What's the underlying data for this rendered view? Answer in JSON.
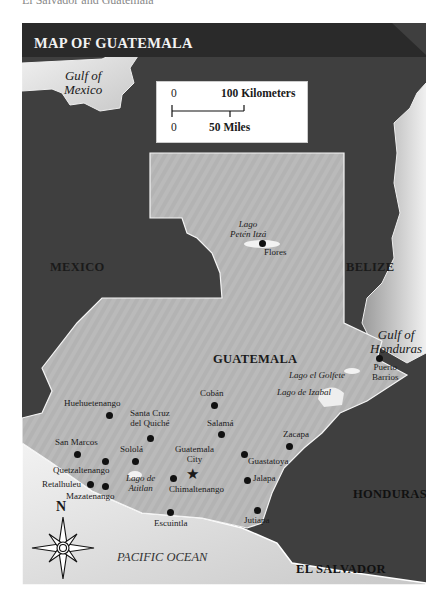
{
  "caption_top": "El Salvador and Guatemala",
  "map": {
    "title": "MAP OF GUATEMALA",
    "scale": {
      "km_zero": "0",
      "km_label": "100 Kilometers",
      "mi_zero": "0",
      "mi_label": "50 Miles"
    },
    "countries": {
      "mexico": "MEXICO",
      "belize": "BELIZE",
      "guatemala": "GUATEMALA",
      "honduras": "HONDURAS",
      "el_salvador": "EL SALVADOR"
    },
    "water": {
      "gulf_mexico_1": "Gulf of",
      "gulf_mexico_2": "Mexico",
      "gulf_honduras_1": "Gulf of",
      "gulf_honduras_2": "Honduras",
      "pacific": "PACIFIC OCEAN"
    },
    "lakes": {
      "peten_1": "Lago",
      "peten_2": "Petén Itzá",
      "golfete": "Lago el Golfete",
      "izabal": "Lago de Izabal",
      "atitlan_1": "Lago de",
      "atitlan_2": "Atitlan"
    },
    "cities": {
      "flores": "Flores",
      "puerto_barrios_1": "Puerto",
      "puerto_barrios_2": "Barrios",
      "coban": "Cobán",
      "huehuetenango": "Huehuetenango",
      "santa_cruz_1": "Santa Cruz",
      "santa_cruz_2": "del Quiché",
      "salama": "Salamá",
      "zacapa": "Zacapa",
      "san_marcos": "San Marcos",
      "solola": "Sololá",
      "guatemala_city_1": "Guatemala",
      "guatemala_city_2": "City",
      "guastatoya": "Guastatoya",
      "quetzaltenango": "Quetzaltenango",
      "retalhuleu": "Retalhuleu",
      "mazatenango": "Mazatenango",
      "chimaltenango": "Chimaltenango",
      "jalapa": "Jalapa",
      "escuintla": "Escuintla",
      "jutiapa": "Jutiapa"
    },
    "compass": {
      "north": "N"
    },
    "colors": {
      "land_other": "#3d3d3d",
      "guatemala": "#b5b5b5",
      "water": "#d9d9d9",
      "header": "#2b2b2b"
    }
  }
}
